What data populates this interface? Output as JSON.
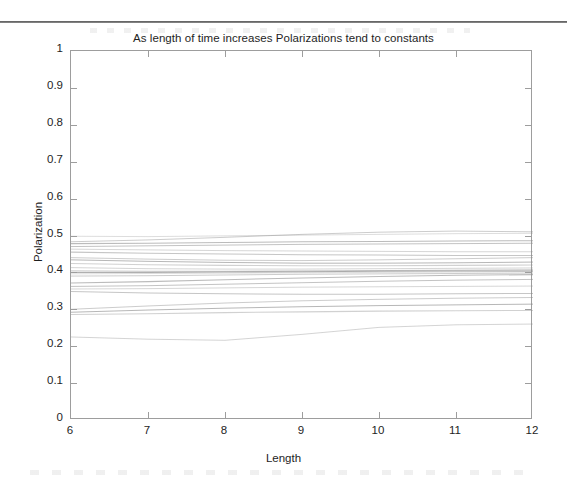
{
  "page": {
    "background": "#ffffff",
    "ink_color": "#1e1e1e",
    "axis_color": "#9d9d9d",
    "line_color": "#8d8d8d",
    "scan_rule_color": "#4a4a4a"
  },
  "chart_data": {
    "type": "line",
    "title": "As length of time increases Polarizations tend to constants",
    "xlabel": "Length",
    "ylabel": "Polarization",
    "xlim": [
      6,
      12
    ],
    "ylim": [
      0,
      1
    ],
    "xticks": [
      6,
      7,
      8,
      9,
      10,
      11,
      12
    ],
    "xticklabels": [
      "6",
      "7",
      "8",
      "9",
      "10",
      "11",
      "12"
    ],
    "yticks": [
      0,
      0.1,
      0.2,
      0.3,
      0.4,
      0.5,
      0.6,
      0.7,
      0.8,
      0.9,
      1
    ],
    "yticklabels": [
      "0",
      "0.1",
      "0.2",
      "0.3",
      "0.4",
      "0.5",
      "0.6",
      "0.7",
      "0.8",
      "0.9",
      "1"
    ],
    "grid": false,
    "legend": false,
    "tick_direction": "in",
    "x": [
      6,
      7,
      8,
      9,
      10,
      11,
      12
    ],
    "series": [
      {
        "name": "p1",
        "values": [
          0.498,
          0.497,
          0.499,
          0.501,
          0.503,
          0.505,
          0.506
        ]
      },
      {
        "name": "p2",
        "values": [
          0.483,
          0.488,
          0.495,
          0.503,
          0.509,
          0.512,
          0.51
        ]
      },
      {
        "name": "p3",
        "values": [
          0.478,
          0.479,
          0.481,
          0.483,
          0.484,
          0.485,
          0.486
        ]
      },
      {
        "name": "p4",
        "values": [
          0.47,
          0.472,
          0.474,
          0.476,
          0.477,
          0.478,
          0.479
        ]
      },
      {
        "name": "p5",
        "values": [
          0.463,
          0.461,
          0.459,
          0.458,
          0.457,
          0.456,
          0.456
        ]
      },
      {
        "name": "p6",
        "values": [
          0.455,
          0.452,
          0.45,
          0.448,
          0.447,
          0.446,
          0.446
        ]
      },
      {
        "name": "p7",
        "values": [
          0.44,
          0.436,
          0.433,
          0.432,
          0.434,
          0.437,
          0.44
        ]
      },
      {
        "name": "p8",
        "values": [
          0.434,
          0.43,
          0.427,
          0.425,
          0.425,
          0.426,
          0.428
        ]
      },
      {
        "name": "p9",
        "values": [
          0.424,
          0.421,
          0.419,
          0.418,
          0.418,
          0.419,
          0.42
        ]
      },
      {
        "name": "p10",
        "values": [
          0.413,
          0.41,
          0.409,
          0.409,
          0.41,
          0.411,
          0.412
        ]
      },
      {
        "name": "p11",
        "values": [
          0.404,
          0.403,
          0.403,
          0.404,
          0.405,
          0.406,
          0.407
        ]
      },
      {
        "name": "p12",
        "values": [
          0.4,
          0.4,
          0.401,
          0.402,
          0.403,
          0.404,
          0.404
        ]
      },
      {
        "name": "p13",
        "values": [
          0.396,
          0.397,
          0.398,
          0.399,
          0.4,
          0.401,
          0.402
        ]
      },
      {
        "name": "p14",
        "values": [
          0.39,
          0.391,
          0.393,
          0.395,
          0.396,
          0.397,
          0.398
        ]
      },
      {
        "name": "p15",
        "values": [
          0.371,
          0.375,
          0.38,
          0.385,
          0.389,
          0.392,
          0.394
        ]
      },
      {
        "name": "p16",
        "values": [
          0.362,
          0.364,
          0.368,
          0.372,
          0.376,
          0.379,
          0.381
        ]
      },
      {
        "name": "p17",
        "values": [
          0.355,
          0.356,
          0.358,
          0.36,
          0.361,
          0.362,
          0.363
        ]
      },
      {
        "name": "p18",
        "values": [
          0.348,
          0.344,
          0.342,
          0.341,
          0.341,
          0.342,
          0.343
        ]
      },
      {
        "name": "p19",
        "values": [
          0.3,
          0.309,
          0.317,
          0.323,
          0.327,
          0.33,
          0.332
        ]
      },
      {
        "name": "p20",
        "values": [
          0.292,
          0.298,
          0.303,
          0.307,
          0.31,
          0.312,
          0.314
        ]
      },
      {
        "name": "p21",
        "values": [
          0.286,
          0.288,
          0.291,
          0.293,
          0.295,
          0.296,
          0.297
        ]
      },
      {
        "name": "p22",
        "values": [
          0.225,
          0.219,
          0.216,
          0.232,
          0.251,
          0.258,
          0.26
        ]
      }
    ]
  }
}
